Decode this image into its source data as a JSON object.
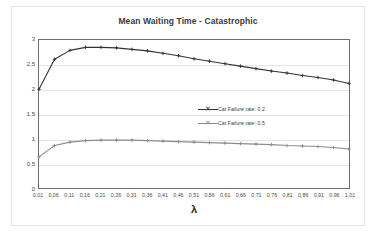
{
  "chart_data": {
    "type": "line",
    "title": "Mean Waiting Time - Catastrophic",
    "xlabel": "λ",
    "ylabel": "",
    "grid": true,
    "legend_position": "center",
    "xlim": [
      0.01,
      1.01
    ],
    "ylim": [
      0,
      3
    ],
    "ytick_labels": [
      "0",
      "0,5",
      "1",
      "1,5",
      "2",
      "2,5",
      "3"
    ],
    "ytick_values": [
      0,
      0.5,
      1,
      1.5,
      2,
      2.5,
      3
    ],
    "x": [
      0.01,
      0.06,
      0.11,
      0.16,
      0.21,
      0.26,
      0.31,
      0.36,
      0.41,
      0.46,
      0.51,
      0.56,
      0.61,
      0.66,
      0.71,
      0.76,
      0.81,
      0.86,
      0.91,
      0.96,
      1.01
    ],
    "xtick_labels": [
      "0,01",
      "0,06",
      "0,11",
      "0,16",
      "0,21",
      "0,26",
      "0,31",
      "0,36",
      "0,41",
      "0,46",
      "0,51",
      "0,56",
      "0,61",
      "0,66",
      "0,71",
      "0,76",
      "0,81",
      "0,86",
      "0,91",
      "0,96",
      "1,01"
    ],
    "series": [
      {
        "name": "Cat Failure rate: 0.2",
        "color": "#333333",
        "marker": "cross",
        "values": [
          2.0,
          2.61,
          2.79,
          2.85,
          2.85,
          2.84,
          2.81,
          2.78,
          2.73,
          2.68,
          2.62,
          2.57,
          2.52,
          2.47,
          2.42,
          2.37,
          2.33,
          2.28,
          2.24,
          2.19,
          2.12
        ]
      },
      {
        "name": "Cat Failure rate: 0.5",
        "color": "#8c8c8c",
        "marker": "cross",
        "values": [
          0.63,
          0.86,
          0.93,
          0.96,
          0.97,
          0.97,
          0.97,
          0.96,
          0.95,
          0.94,
          0.93,
          0.92,
          0.91,
          0.9,
          0.89,
          0.88,
          0.86,
          0.85,
          0.84,
          0.82,
          0.79
        ]
      }
    ]
  },
  "legend": {
    "items": [
      {
        "label": "Cat Failure rate: 0.2"
      },
      {
        "label": "Cat Failure rate: 0.5"
      }
    ]
  }
}
